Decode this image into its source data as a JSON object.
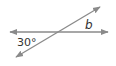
{
  "diagram": {
    "type": "intersecting-lines",
    "line_color": "#8a8a8a",
    "text_color": "#333333",
    "lines": [
      {
        "name": "horizontal-line",
        "x1": 8,
        "y1": 32,
        "x2": 110,
        "y2": 32,
        "arrows": "both"
      },
      {
        "name": "diagonal-line",
        "x1": 14,
        "y1": 58,
        "x2": 102,
        "y2": 6,
        "arrows": "both"
      }
    ],
    "labels": {
      "angle_known": "30°",
      "angle_unknown": "b"
    }
  }
}
